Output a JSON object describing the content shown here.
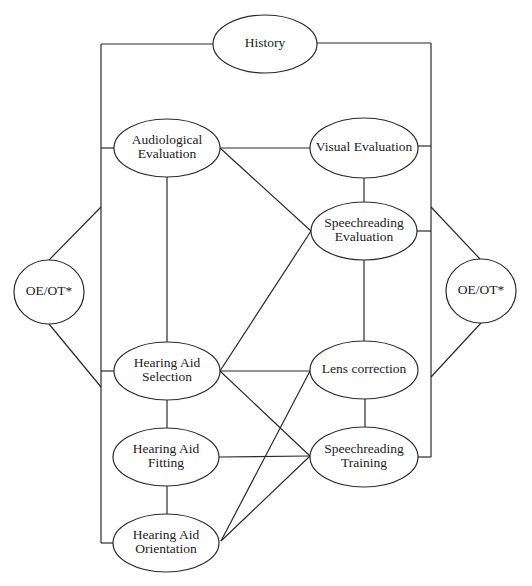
{
  "diagram": {
    "type": "flow-network",
    "colors": {
      "stroke": "#2a2a2a",
      "text": "#222222",
      "background": "#ffffff"
    },
    "nodes": [
      {
        "id": "history",
        "lines": [
          "History"
        ],
        "cx": 265,
        "cy": 44,
        "rx": 52,
        "ry": 29
      },
      {
        "id": "audiological-evaluation",
        "lines": [
          "Audiological",
          "Evaluation"
        ],
        "cx": 167,
        "cy": 148,
        "rx": 53,
        "ry": 29
      },
      {
        "id": "visual-evaluation",
        "lines": [
          "Visual Evaluation"
        ],
        "cx": 364,
        "cy": 148,
        "rx": 54,
        "ry": 30
      },
      {
        "id": "speechreading-evaluation",
        "lines": [
          "Speechreading",
          "Evaluation"
        ],
        "cx": 364,
        "cy": 231,
        "rx": 53,
        "ry": 29
      },
      {
        "id": "oe-ot-left",
        "lines": [
          "OE/OT*"
        ],
        "cx": 49,
        "cy": 292,
        "rx": 35,
        "ry": 32
      },
      {
        "id": "oe-ot-right",
        "lines": [
          "OE/OT*"
        ],
        "cx": 481,
        "cy": 291,
        "rx": 35,
        "ry": 32
      },
      {
        "id": "hearing-aid-selection",
        "lines": [
          "Hearing Aid",
          "Selection"
        ],
        "cx": 167,
        "cy": 371,
        "rx": 53,
        "ry": 29
      },
      {
        "id": "lens-correction",
        "lines": [
          "Lens correction"
        ],
        "cx": 364,
        "cy": 370,
        "rx": 54,
        "ry": 29
      },
      {
        "id": "hearing-aid-fitting",
        "lines": [
          "Hearing Aid",
          "Fitting"
        ],
        "cx": 166,
        "cy": 457,
        "rx": 53,
        "ry": 29
      },
      {
        "id": "speechreading-training",
        "lines": [
          "Speechreading",
          "Training"
        ],
        "cx": 364,
        "cy": 457,
        "rx": 54,
        "ry": 30
      },
      {
        "id": "hearing-aid-orientation",
        "lines": [
          "Hearing Aid",
          "Orientation"
        ],
        "cx": 166,
        "cy": 543,
        "rx": 53,
        "ry": 29
      }
    ],
    "edges": [
      {
        "from": "history",
        "to": "left-bus",
        "points": [
          [
            213,
            44
          ],
          [
            101,
            44
          ]
        ]
      },
      {
        "from": "history",
        "to": "right-bus",
        "points": [
          [
            317,
            43
          ],
          [
            431,
            43
          ]
        ]
      },
      {
        "from": "left-bus",
        "to": "left-bus",
        "points": [
          [
            101,
            44
          ],
          [
            101,
            543
          ]
        ]
      },
      {
        "from": "right-bus",
        "to": "right-bus",
        "points": [
          [
            431,
            43
          ],
          [
            431,
            457
          ]
        ]
      },
      {
        "from": "left-bus",
        "to": "audiological-evaluation",
        "points": [
          [
            101,
            148
          ],
          [
            114,
            148
          ]
        ]
      },
      {
        "from": "left-bus",
        "to": "hearing-aid-selection",
        "points": [
          [
            101,
            371
          ],
          [
            114,
            371
          ]
        ]
      },
      {
        "from": "left-bus",
        "to": "hearing-aid-orientation",
        "points": [
          [
            101,
            543
          ],
          [
            113,
            543
          ]
        ]
      },
      {
        "from": "right-bus",
        "to": "visual-evaluation",
        "points": [
          [
            418,
            146
          ],
          [
            431,
            146
          ]
        ]
      },
      {
        "from": "right-bus",
        "to": "speechreading-evaluation",
        "points": [
          [
            417,
            231
          ],
          [
            431,
            231
          ]
        ]
      },
      {
        "from": "right-bus",
        "to": "speechreading-training",
        "points": [
          [
            418,
            457
          ],
          [
            431,
            457
          ]
        ]
      },
      {
        "from": "oe-ot-left",
        "to": "left-bus",
        "points": [
          [
            49,
            260
          ],
          [
            101,
            207
          ]
        ]
      },
      {
        "from": "oe-ot-left",
        "to": "left-bus",
        "points": [
          [
            49,
            324
          ],
          [
            101,
            387
          ]
        ]
      },
      {
        "from": "oe-ot-right",
        "to": "right-bus",
        "points": [
          [
            480,
            259
          ],
          [
            431,
            207
          ]
        ]
      },
      {
        "from": "oe-ot-right",
        "to": "right-bus",
        "points": [
          [
            481,
            323
          ],
          [
            431,
            377
          ]
        ]
      },
      {
        "from": "audiological-evaluation",
        "to": "visual-evaluation",
        "points": [
          [
            220,
            148
          ],
          [
            310,
            148
          ]
        ]
      },
      {
        "from": "audiological-evaluation",
        "to": "speechreading-evaluation",
        "points": [
          [
            220,
            148
          ],
          [
            311,
            231
          ]
        ]
      },
      {
        "from": "audiological-evaluation",
        "to": "hearing-aid-selection",
        "points": [
          [
            167,
            177
          ],
          [
            167,
            342
          ]
        ]
      },
      {
        "from": "visual-evaluation",
        "to": "speechreading-evaluation",
        "points": [
          [
            364,
            178
          ],
          [
            364,
            202
          ]
        ]
      },
      {
        "from": "speechreading-evaluation",
        "to": "lens-correction",
        "points": [
          [
            364,
            260
          ],
          [
            364,
            341
          ]
        ]
      },
      {
        "from": "hearing-aid-selection",
        "to": "speechreading-evaluation",
        "points": [
          [
            220,
            371
          ],
          [
            311,
            231
          ]
        ]
      },
      {
        "from": "hearing-aid-selection",
        "to": "lens-correction",
        "points": [
          [
            220,
            371
          ],
          [
            310,
            371
          ]
        ]
      },
      {
        "from": "hearing-aid-selection",
        "to": "speechreading-training",
        "points": [
          [
            220,
            371
          ],
          [
            310,
            456
          ]
        ]
      },
      {
        "from": "lens-correction",
        "to": "speechreading-training",
        "points": [
          [
            365,
            399
          ],
          [
            365,
            427
          ]
        ]
      },
      {
        "from": "hearing-aid-selection",
        "to": "hearing-aid-fitting",
        "points": [
          [
            167,
            400
          ],
          [
            167,
            428
          ]
        ]
      },
      {
        "from": "hearing-aid-fitting",
        "to": "hearing-aid-orientation",
        "points": [
          [
            167,
            486
          ],
          [
            167,
            514
          ]
        ]
      },
      {
        "from": "hearing-aid-fitting",
        "to": "speechreading-training",
        "points": [
          [
            219,
            457
          ],
          [
            310,
            456
          ]
        ]
      },
      {
        "from": "hearing-aid-orientation",
        "to": "lens-correction",
        "points": [
          [
            221,
            541
          ],
          [
            310,
            371
          ]
        ]
      },
      {
        "from": "hearing-aid-orientation",
        "to": "speechreading-training",
        "points": [
          [
            221,
            541
          ],
          [
            310,
            456
          ]
        ]
      }
    ]
  }
}
